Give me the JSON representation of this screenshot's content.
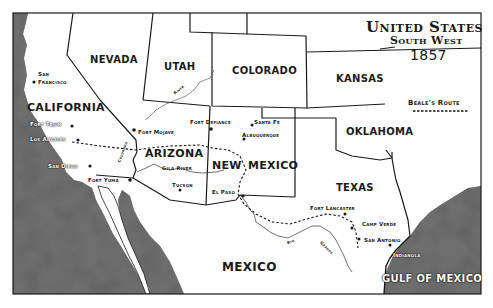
{
  "title": {
    "line1": "United States",
    "line2": "South West",
    "year": "1857"
  },
  "legend": {
    "label": "Beale's Route",
    "line_style": "dashed"
  },
  "states": {
    "nevada": "NEVADA",
    "utah": "UTAH",
    "colorado": "COLORADO",
    "kansas": "KANSAS",
    "california": "CALIFORNIA",
    "arizona": "ARIZONA",
    "new": "NEW",
    "mexico_state": "MEXICO",
    "oklahoma": "OKLAHOMA",
    "texas": "TEXAS"
  },
  "regions": {
    "mexico": "MEXICO",
    "gulf": "GULF OF MEXICO"
  },
  "cities": {
    "san_francisco_1": "San",
    "san_francisco_2": "Francisco",
    "fort_tejon": "Fort Tejon",
    "los_angeles": "Los Angeles",
    "san_diego": "San Diego",
    "fort_yuma": "Fort Yuma",
    "fort_mojave": "Fort Mojave",
    "fort_defiance": "Fort Defiance",
    "santa_fe": "Santa Fe",
    "albuquerque": "Albuquerque",
    "tucson": "Tucson",
    "el_paso": "El Paso",
    "fort_lancaster": "Fort Lancaster",
    "camp_verde": "Camp Verde",
    "san_antonio": "San Antonio",
    "indianola": "Indianola"
  },
  "rivers": {
    "river_utah": "River",
    "colorado": "Colorado",
    "gila": "Gila River",
    "rio": "Rio",
    "grande": "Grande"
  },
  "colors": {
    "ink": "#1a1a1a",
    "land": "#ffffff",
    "sea_dark": "#3a3a3a",
    "sea_light": "#8a8a8a"
  }
}
